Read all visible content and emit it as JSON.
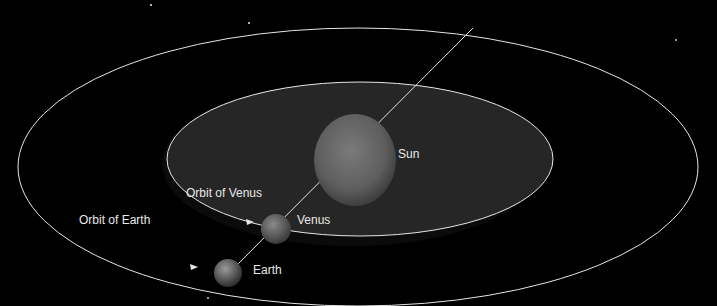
{
  "diagram": {
    "labels": {
      "sun": "Sun",
      "venus": "Venus",
      "earth": "Earth",
      "orbit_venus": "Orbit of Venus",
      "orbit_earth": "Orbit of Earth"
    },
    "colors": {
      "background": "#000000",
      "orbit_line": "#e6e6e6",
      "venus_orbit_fill": "#2a2a2a",
      "sun": "#6e6e6e",
      "label": "#e8e8e8"
    }
  }
}
